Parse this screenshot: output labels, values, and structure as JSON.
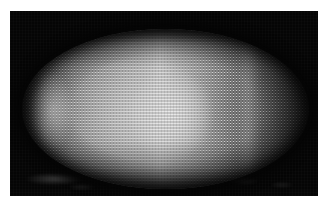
{
  "figure": {
    "kind": "fluorescence-micrograph",
    "view": "lateral, anterior left, dorsal up",
    "channel": "nuclear stain (grayscale)",
    "caption": "",
    "panel_label": ""
  },
  "canvas": {
    "width_px": 327,
    "height_px": 202,
    "page_background": "#ffffff"
  },
  "panel": {
    "name": "micrograph-panel",
    "left_px": 10,
    "top_px": 11,
    "width_px": 308,
    "height_px": 185,
    "background_color": "#050505",
    "border": "none"
  },
  "embryo": {
    "left_px": 12,
    "top_px": 18,
    "width_px": 287,
    "height_px": 160,
    "shape": "ellipse",
    "nucleus_spacing_px": 3,
    "nucleus_radius_px": 1.05,
    "colors": {
      "background": "#050505",
      "darkest_cortex": "#141414",
      "mid_gray": "#9a9a9a",
      "bright_domain": "#efefef",
      "highlight": "#ffffff"
    }
  },
  "intensity_profile": {
    "axis": "anterior-posterior (left to right)",
    "sample_positions_pct": [
      0,
      8,
      18,
      30,
      42,
      48,
      56,
      66,
      76,
      86,
      95,
      100
    ],
    "sample_values_0_255": [
      42,
      110,
      154,
      180,
      216,
      239,
      205,
      162,
      119,
      78,
      38,
      20
    ],
    "peak_position_pct": 48,
    "peak_value_0_255": 239
  },
  "features": {
    "anterior_crescent": "bright cortical crescent at anterior pole",
    "posterior_band": "faint lighter band in posterior third",
    "ventral_debris": "out-of-focus yolk debris along ventral/lower background",
    "vignette": "dark vignette at embryo rim blending into black field"
  }
}
